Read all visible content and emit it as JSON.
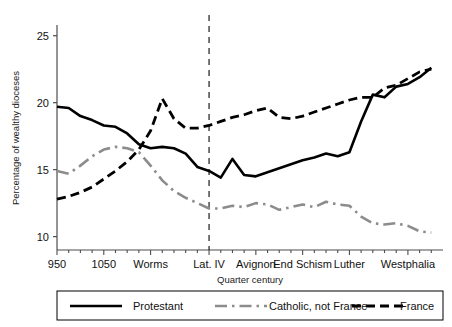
{
  "chart_data": {
    "type": "line",
    "title": "",
    "xlabel": "Quarter century",
    "ylabel": "Percentage of wealthy dioceses",
    "ylim": [
      9.0,
      25.8
    ],
    "yticks": [
      10,
      15,
      20,
      25
    ],
    "ytick_labels": [
      "10",
      "15",
      "20",
      "25"
    ],
    "xlim": [
      0,
      33
    ],
    "xtick_positions": [
      0,
      4,
      8,
      13,
      17,
      21,
      25,
      30
    ],
    "xtick_labels": [
      "950",
      "1050",
      "Worms",
      "Lat. IV",
      "Avignon",
      "End Schism",
      "Luther",
      "Westphalia"
    ],
    "grid": false,
    "legend_position": "bottom",
    "annotations": [
      {
        "type": "vline",
        "x": 13,
        "label": "Lat. IV",
        "style": "dashed"
      }
    ],
    "series": [
      {
        "name": "Protestant",
        "color": "#000000",
        "style": "solid",
        "x": [
          0,
          1,
          2,
          3,
          4,
          5,
          6,
          7,
          8,
          9,
          10,
          11,
          12,
          13,
          14,
          15,
          16,
          17,
          18,
          19,
          20,
          21,
          22,
          23,
          24,
          25,
          26,
          27,
          28,
          29,
          30,
          31,
          32
        ],
        "values": [
          19.7,
          19.6,
          19.0,
          18.7,
          18.3,
          18.2,
          17.7,
          16.9,
          16.6,
          16.7,
          16.6,
          16.2,
          15.2,
          14.9,
          14.4,
          15.8,
          14.6,
          14.5,
          14.8,
          15.1,
          15.4,
          15.7,
          15.9,
          16.2,
          16.0,
          16.3,
          18.6,
          20.6,
          20.4,
          21.2,
          21.4,
          21.9,
          22.6
        ]
      },
      {
        "name": "Catholic, not France",
        "color": "#8c8c8c",
        "style": "dashdot",
        "x": [
          0,
          1,
          2,
          3,
          4,
          5,
          6,
          7,
          8,
          9,
          10,
          11,
          12,
          13,
          14,
          15,
          16,
          17,
          18,
          19,
          20,
          21,
          22,
          23,
          24,
          25,
          26,
          27,
          28,
          29,
          30,
          31,
          32
        ],
        "values": [
          14.9,
          14.7,
          15.3,
          16.0,
          16.5,
          16.7,
          16.6,
          16.3,
          15.3,
          14.2,
          13.4,
          12.9,
          12.5,
          12.1,
          12.1,
          12.3,
          12.2,
          12.5,
          12.4,
          12.0,
          12.2,
          12.4,
          12.2,
          12.6,
          12.4,
          12.3,
          11.5,
          11.0,
          10.9,
          11.0,
          10.8,
          10.4,
          10.3
        ]
      },
      {
        "name": "France",
        "color": "#000000",
        "style": "dashed",
        "x": [
          0,
          1,
          2,
          3,
          4,
          5,
          6,
          7,
          8,
          9,
          10,
          11,
          12,
          13,
          14,
          15,
          16,
          17,
          18,
          19,
          20,
          21,
          22,
          23,
          24,
          25,
          26,
          27,
          28,
          29,
          30,
          31,
          32
        ],
        "values": [
          12.8,
          13.0,
          13.3,
          13.7,
          14.3,
          14.9,
          15.6,
          16.5,
          17.9,
          20.3,
          18.8,
          18.1,
          18.1,
          18.3,
          18.6,
          18.9,
          19.1,
          19.4,
          19.6,
          18.9,
          18.8,
          19.0,
          19.3,
          19.6,
          19.9,
          20.2,
          20.4,
          20.4,
          21.1,
          21.3,
          21.8,
          22.3,
          22.5
        ]
      }
    ]
  },
  "legend": {
    "entries": [
      {
        "label": "Protestant",
        "style": "solid",
        "color": "#000000"
      },
      {
        "label": "Catholic, not France",
        "style": "dashdot",
        "color": "#8c8c8c"
      },
      {
        "label": "France",
        "style": "dashed",
        "color": "#000000"
      }
    ]
  }
}
